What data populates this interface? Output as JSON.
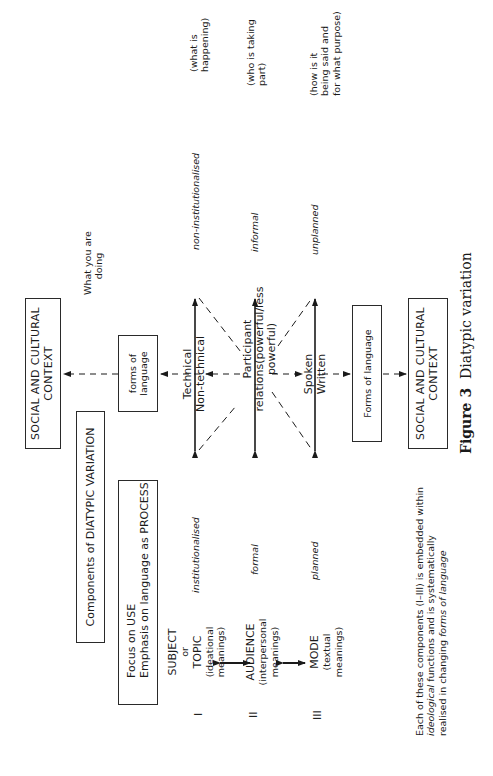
{
  "figure": {
    "caption_label": "Figure 3",
    "caption_title": "Diatypic variation"
  },
  "boxes": {
    "social_top": {
      "line1": "SOCIAL AND CULTURAL",
      "line2": "CONTEXT"
    },
    "forms_top": {
      "line1": "forms of",
      "line2": "language"
    },
    "components": {
      "label": "Components of DIATYPIC VARIATION"
    },
    "focus": {
      "line1": "Focus on USE",
      "line2": "Emphasis on language as PROCESS"
    },
    "forms_bottom": {
      "label": "Forms of language"
    },
    "social_bottom": {
      "line1": "SOCIAL AND CULTURAL",
      "line2": "CONTEXT"
    }
  },
  "what_you_are_doing": {
    "line1": "What you are",
    "line2": "doing"
  },
  "components": [
    {
      "numeral": "I",
      "name_lines": [
        "SUBJECT",
        "or",
        "TOPIC"
      ],
      "meaning_lines": [
        "(ideational",
        "meanings)"
      ],
      "left_pole": "institutionalised",
      "right_pole": "non-institutionalised",
      "gloss_lines": [
        "(what is",
        "happening)"
      ]
    },
    {
      "numeral": "II",
      "name_lines": [
        "AUDIENCE"
      ],
      "meaning_lines": [
        "(interpersonal",
        "meanings)"
      ],
      "left_pole": "formal",
      "right_pole": "informal",
      "gloss_lines": [
        "(who is taking",
        "part)"
      ]
    },
    {
      "numeral": "III",
      "name_lines": [
        "MODE"
      ],
      "meaning_lines": [
        "(textual",
        "meanings)"
      ],
      "left_pole": "planned",
      "right_pole": "unplanned",
      "gloss_lines": [
        "(how is it",
        "being said and",
        "for what purpose)"
      ]
    }
  ],
  "continua": {
    "field": {
      "line1": "Technical",
      "line2": "Non-technical"
    },
    "tenor": {
      "line1": "Participant",
      "line2": "relations(powerful/less",
      "line3": "powerful)"
    },
    "mode": {
      "line1": "Spoken",
      "line2": "Written"
    }
  },
  "note": {
    "line1": "Each of these components (I–III) is embedded within",
    "line2_italic": "ideological",
    "line2_rest": " functions and is systematically",
    "line3_plain": "realised in changing ",
    "line3_italic": "forms of language"
  }
}
